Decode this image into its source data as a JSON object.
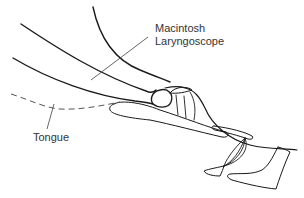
{
  "diagram": {
    "labels": {
      "scope_line1": "Macintosh",
      "scope_line2": "Laryngoscope",
      "tongue": "Tongue"
    },
    "colors": {
      "stroke": "#1a1a1a",
      "leader": "#555555",
      "text": "#333333",
      "background": "#ffffff"
    }
  }
}
